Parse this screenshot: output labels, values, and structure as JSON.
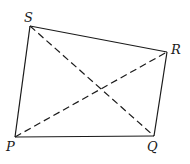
{
  "diagram": {
    "type": "quadrilateral-with-diagonals",
    "colors": {
      "stroke": "#1a1a1a",
      "background": "#ffffff"
    },
    "vertices": [
      {
        "name": "P",
        "x": 15,
        "y": 137,
        "label_x": 6,
        "label_y": 151
      },
      {
        "name": "Q",
        "x": 154,
        "y": 136,
        "label_x": 147,
        "label_y": 151
      },
      {
        "name": "R",
        "x": 167,
        "y": 52,
        "label_x": 171,
        "label_y": 54
      },
      {
        "name": "S",
        "x": 30,
        "y": 26,
        "label_x": 24,
        "label_y": 22
      }
    ],
    "edges": [
      {
        "from": "P",
        "to": "Q",
        "style": "solid"
      },
      {
        "from": "Q",
        "to": "R",
        "style": "solid"
      },
      {
        "from": "R",
        "to": "S",
        "style": "solid"
      },
      {
        "from": "S",
        "to": "P",
        "style": "solid"
      },
      {
        "from": "P",
        "to": "R",
        "style": "dashed"
      },
      {
        "from": "S",
        "to": "Q",
        "style": "dashed"
      }
    ]
  }
}
